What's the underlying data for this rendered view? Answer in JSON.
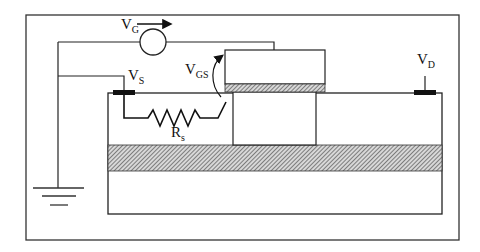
{
  "diagram": {
    "type": "MOSFET cross-section schematic with source resistance",
    "labels": {
      "vg": {
        "main": "V",
        "sub": "G"
      },
      "vs": {
        "main": "V",
        "sub": "S"
      },
      "vgs": {
        "main": "V",
        "sub": "GS"
      },
      "vd": {
        "main": "V",
        "sub": "D"
      },
      "rs": {
        "main": "R",
        "sub": "s"
      }
    },
    "components": [
      "voltage-source-vg",
      "ground",
      "source-contact",
      "drain-contact",
      "gate-electrode",
      "gate-oxide",
      "source-resistor-rs",
      "channel-region",
      "buried-layer",
      "substrate"
    ],
    "colors": {
      "line": "#222222",
      "contact": "#111111",
      "hatch": "#555555",
      "background": "#ffffff"
    }
  }
}
